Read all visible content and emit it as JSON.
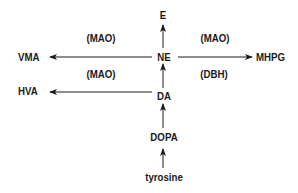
{
  "diagram": {
    "type": "catecholamine metabolic pathway",
    "nodes": {
      "e": "E",
      "ne": "NE",
      "da": "DA",
      "dopa": "DOPA",
      "tyrosine": "tyrosine",
      "vma": "VMA",
      "hva": "HVA",
      "mhpg": "MHPG"
    },
    "enzymes": {
      "ne_to_vma": "(MAO)",
      "da_to_hva": "(MAO)",
      "ne_to_mhpg": "(MAO)",
      "da_to_ne": "(DBH)"
    },
    "edges": [
      {
        "from": "tyrosine",
        "to": "DOPA"
      },
      {
        "from": "DOPA",
        "to": "DA"
      },
      {
        "from": "DA",
        "to": "NE"
      },
      {
        "from": "NE",
        "to": "E"
      },
      {
        "from": "NE",
        "to": "VMA",
        "label": "(MAO)"
      },
      {
        "from": "DA",
        "to": "HVA",
        "label": "(MAO)"
      },
      {
        "from": "NE",
        "to": "MHPG",
        "label": "(MAO)"
      }
    ],
    "colors": {
      "ink": "#1a1a1a",
      "background": "#ffffff"
    }
  }
}
